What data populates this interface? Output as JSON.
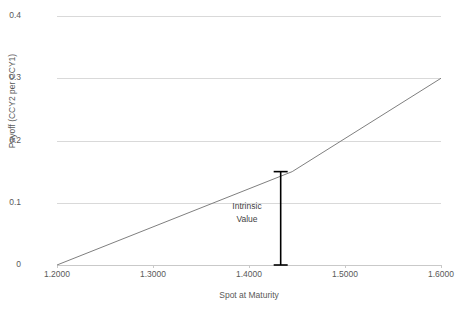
{
  "chart_data": {
    "type": "line",
    "title": "",
    "xlabel": "Spot at Maturity",
    "ylabel": "Payoff (CCY2 per CCY1)",
    "xlim": [
      1.2,
      1.6
    ],
    "ylim": [
      0,
      0.4
    ],
    "grid": true,
    "legend": "none",
    "x_ticks": [
      "1.2000",
      "1.3000",
      "1.4000",
      "1.5000",
      "1.6000"
    ],
    "x_tick_values": [
      1.2,
      1.3,
      1.4,
      1.5,
      1.6
    ],
    "y_ticks": [
      "0",
      "0.1",
      "0.2",
      "0.3",
      "0.4"
    ],
    "y_tick_values": [
      0,
      0.1,
      0.2,
      0.3,
      0.4
    ],
    "series": [
      {
        "name": "Payoff",
        "color": "#7f7f7f",
        "x": [
          1.2,
          1.445,
          1.6
        ],
        "values": [
          0.0,
          0.15,
          0.3
        ]
      }
    ],
    "annotations": [
      {
        "name": "intrinsic-value",
        "line1": "Intrinsic",
        "line2": "Value",
        "color": "#000000",
        "x": 1.433,
        "y_from": 0.0,
        "y_to": 0.15
      }
    ]
  },
  "axes": {
    "y_tick_labels": [
      "0.4",
      "0.3",
      "0.2",
      "0.1",
      "0"
    ],
    "x_tick_labels": [
      "1.2000",
      "1.3000",
      "1.4000",
      "1.5000",
      "1.6000"
    ],
    "x_title": "Spot at Maturity",
    "y_title": "Payoff (CCY2 per CCY1)"
  },
  "annotation": {
    "line1": "Intrinsic",
    "line2": "Value"
  },
  "colors": {
    "gridline": "#d9d9d9",
    "baseline": "#c9c9c9",
    "series": "#7f7f7f",
    "annotation": "#000000",
    "text": "#595959",
    "background": "#ffffff"
  }
}
